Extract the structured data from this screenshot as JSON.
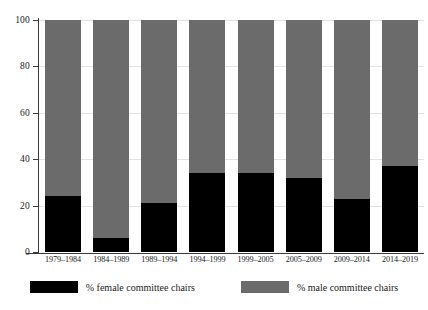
{
  "chart_data": {
    "type": "bar",
    "subtype": "stacked-100-percent",
    "title": "",
    "subtitle": "",
    "xlabel": "",
    "ylabel": "",
    "ylim": [
      0,
      100
    ],
    "yticks": [
      0,
      20,
      40,
      60,
      80,
      100
    ],
    "ytick_labels": [
      "0",
      "20",
      "40",
      "60",
      "80",
      "100"
    ],
    "grid": true,
    "grid_axis": "y",
    "legend_position": "bottom",
    "categories": [
      "1979–1984",
      "1984–1989",
      "1989–1994",
      "1994–1999",
      "1999–2005",
      "2005–2009",
      "2009–2014",
      "2014–2019"
    ],
    "series": [
      {
        "name": "% female committee chairs",
        "color": "#000000",
        "values": [
          24,
          6,
          21,
          34,
          34,
          32,
          23,
          37
        ]
      },
      {
        "name": "% male committee chairs",
        "color": "#6b6b6b",
        "values": [
          76,
          94,
          79,
          66,
          66,
          68,
          77,
          63
        ]
      }
    ]
  },
  "legend": {
    "items": [
      {
        "label": "% female committee chairs",
        "color": "#000000"
      },
      {
        "label": "% male committee chairs",
        "color": "#6b6b6b"
      }
    ]
  },
  "colors": {
    "female": "#000000",
    "male": "#6b6b6b",
    "axis": "#3a3a3a",
    "grid": "#e2e2e2",
    "background": "#ffffff"
  }
}
